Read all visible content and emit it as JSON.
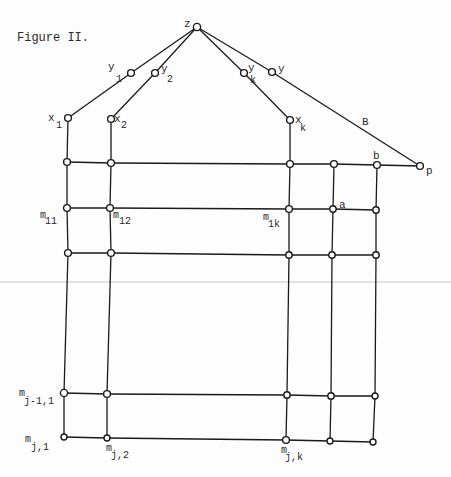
{
  "figure": {
    "title": "Figure II."
  },
  "labels": {
    "z": "z",
    "y1": {
      "base": "y",
      "sub": "1"
    },
    "y2": {
      "base": "y",
      "sub": "2"
    },
    "yk": {
      "base": "y",
      "sub": "k"
    },
    "y": "y",
    "x1": {
      "base": "x",
      "sub": "1"
    },
    "x2": {
      "base": "x",
      "sub": "2"
    },
    "xk": {
      "base": "x",
      "sub": "k"
    },
    "B": "B",
    "p": "p",
    "b": "b",
    "a": "a",
    "m11": {
      "base": "m",
      "sub": "11"
    },
    "m12": {
      "base": "m",
      "sub": "12"
    },
    "m1k": {
      "base": "m",
      "sub": "1k"
    },
    "mj1_1": {
      "base": "m",
      "sub": "j-1,1"
    },
    "mj_1": {
      "base": "m",
      "sub": "j,1"
    },
    "mj_2": {
      "base": "m",
      "sub": "j,2"
    },
    "mj_k": {
      "base": "m",
      "sub": "j,k"
    }
  },
  "colors": {
    "line": "#1a1a1a",
    "text": "#2a2a2a",
    "background": "#fdfdfd",
    "scan_rule": "#b8b8b8"
  }
}
